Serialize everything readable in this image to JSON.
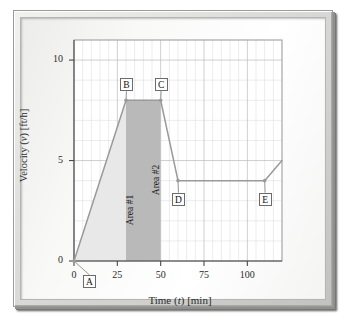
{
  "figure": {
    "frame_style": "beveled-3d-picture-frame",
    "background_color": "#ffffff"
  },
  "chart_data": {
    "type": "line",
    "title": "",
    "subtitle": "",
    "xlabel": "Time (t) [min]",
    "xlabel_parts": {
      "prefix": "Time (",
      "italic": "t",
      "suffix": ") [min]"
    },
    "ylabel": "Velocity (v) [ft/h]",
    "ylabel_parts": {
      "prefix": "Velocity (",
      "italic": "v",
      "suffix": ") [ft/h]"
    },
    "xlim": [
      0,
      120
    ],
    "ylim": [
      0,
      11
    ],
    "xticks": [
      0,
      25,
      50,
      75,
      100
    ],
    "xtick_labels": [
      "0",
      "25",
      "50",
      "75",
      "100"
    ],
    "yticks": [
      0,
      5,
      10
    ],
    "ytick_labels": [
      "0",
      "5",
      "10"
    ],
    "grid": true,
    "grid_minor_x_step": 5,
    "grid_minor_y_step": 1,
    "legend": "none",
    "line_color": "#9a9a9a",
    "series": [
      {
        "name": "velocity",
        "x": [
          0,
          30,
          50,
          60,
          110,
          120
        ],
        "values": [
          0,
          8,
          8,
          4,
          4,
          5
        ]
      }
    ],
    "points": [
      {
        "id": "A",
        "label": "A",
        "x": 0,
        "y": 0
      },
      {
        "id": "B",
        "label": "B",
        "x": 30,
        "y": 8
      },
      {
        "id": "C",
        "label": "C",
        "x": 50,
        "y": 8
      },
      {
        "id": "D",
        "label": "D",
        "x": 60,
        "y": 4
      },
      {
        "id": "E",
        "label": "E",
        "x": 110,
        "y": 4
      }
    ],
    "annotations": [
      {
        "id": "area1",
        "label": "Area #1",
        "x_start": 0,
        "x_end": 30,
        "fill_color": "#e8e8e8",
        "description": "triangular area under rising segment A to B"
      },
      {
        "id": "area2",
        "label": "Area #2",
        "x_start": 30,
        "x_end": 50,
        "fill_color": "#b9b9b9",
        "description": "rectangular area under plateau B to C"
      }
    ]
  }
}
